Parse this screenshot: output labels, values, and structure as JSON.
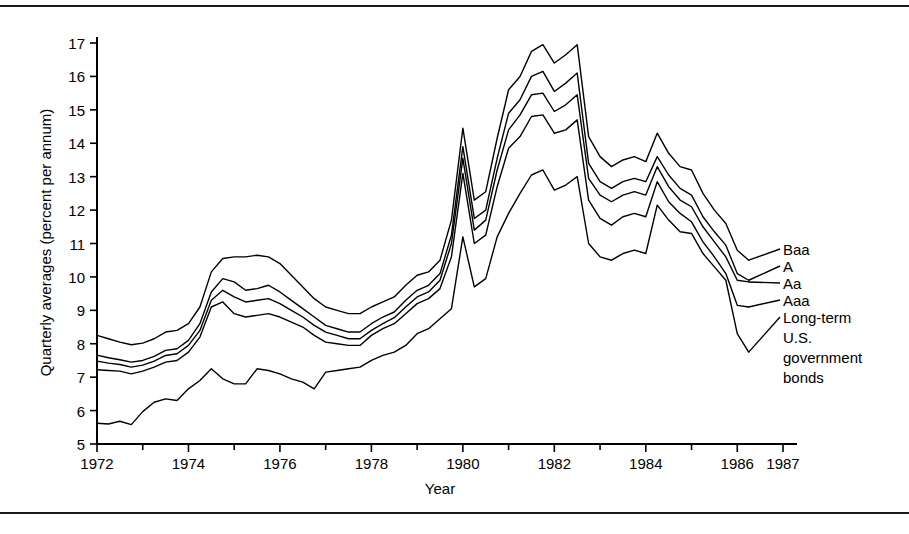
{
  "figure": {
    "background_color": "#ffffff",
    "ink_color": "#000000",
    "rule_top_label": "top-divider-rule",
    "rule_bottom_label": "bottom-divider-rule"
  },
  "chart_data": {
    "type": "line",
    "title": "",
    "subtitle": "",
    "xlabel": "Year",
    "ylabel": "Quarterly averages (percent per annum)",
    "xlim": [
      1972,
      1987
    ],
    "ylim": [
      5,
      17
    ],
    "grid": false,
    "legend_position": "right-inline-labels",
    "x_tick_labels": [
      "1972",
      "1974",
      "1976",
      "1978",
      "1980",
      "1982",
      "1984",
      "1986",
      "1987"
    ],
    "x_tick_values": [
      1972,
      1974,
      1976,
      1978,
      1980,
      1982,
      1984,
      1986,
      1987
    ],
    "x_minor_tick_values": [
      1973,
      1975,
      1977,
      1979,
      1981,
      1983,
      1985
    ],
    "y_tick_labels": [
      "5",
      "6",
      "7",
      "8",
      "9",
      "10",
      "11",
      "12",
      "13",
      "14",
      "15",
      "16",
      "17"
    ],
    "y_tick_values": [
      5,
      6,
      7,
      8,
      9,
      10,
      11,
      12,
      13,
      14,
      15,
      16,
      17
    ],
    "x": [
      1972.0,
      1972.25,
      1972.5,
      1972.75,
      1973.0,
      1973.25,
      1973.5,
      1973.75,
      1974.0,
      1974.25,
      1974.5,
      1974.75,
      1975.0,
      1975.25,
      1975.5,
      1975.75,
      1976.0,
      1976.25,
      1976.5,
      1976.75,
      1977.0,
      1977.25,
      1977.5,
      1977.75,
      1978.0,
      1978.25,
      1978.5,
      1978.75,
      1979.0,
      1979.25,
      1979.5,
      1979.75,
      1980.0,
      1980.25,
      1980.5,
      1980.75,
      1981.0,
      1981.25,
      1981.5,
      1981.75,
      1982.0,
      1982.25,
      1982.5,
      1982.75,
      1983.0,
      1983.25,
      1983.5,
      1983.75,
      1984.0,
      1984.25,
      1984.5,
      1984.75,
      1985.0,
      1985.25,
      1985.5,
      1985.75,
      1986.0,
      1986.25
    ],
    "series": [
      {
        "name": "Baa",
        "label": "Baa",
        "values": [
          8.25,
          8.15,
          8.05,
          7.97,
          8.02,
          8.15,
          8.35,
          8.4,
          8.6,
          9.1,
          10.15,
          10.55,
          10.6,
          10.6,
          10.65,
          10.6,
          10.4,
          10.05,
          9.7,
          9.35,
          9.1,
          9.0,
          8.9,
          8.9,
          9.1,
          9.25,
          9.4,
          9.75,
          10.05,
          10.15,
          10.5,
          11.7,
          14.45,
          12.3,
          12.55,
          14.15,
          15.6,
          16.0,
          16.75,
          16.95,
          16.4,
          16.65,
          16.95,
          14.2,
          13.6,
          13.3,
          13.5,
          13.6,
          13.45,
          14.3,
          13.7,
          13.3,
          13.2,
          12.5,
          12.0,
          11.6,
          10.8,
          10.5
        ]
      },
      {
        "name": "A",
        "label": "A",
        "values": [
          7.66,
          7.58,
          7.52,
          7.45,
          7.5,
          7.62,
          7.8,
          7.85,
          8.1,
          8.6,
          9.55,
          9.95,
          9.85,
          9.6,
          9.65,
          9.75,
          9.55,
          9.3,
          9.05,
          8.8,
          8.55,
          8.45,
          8.35,
          8.35,
          8.6,
          8.8,
          8.95,
          9.3,
          9.6,
          9.75,
          10.1,
          11.25,
          13.9,
          11.75,
          12.0,
          13.55,
          14.9,
          15.3,
          16.0,
          16.15,
          15.55,
          15.8,
          16.1,
          13.4,
          12.85,
          12.65,
          12.85,
          12.95,
          12.85,
          13.6,
          13.05,
          12.65,
          12.45,
          11.8,
          11.35,
          10.95,
          10.1,
          9.9
        ]
      },
      {
        "name": "Aa",
        "label": "Aa",
        "values": [
          7.48,
          7.42,
          7.38,
          7.3,
          7.36,
          7.48,
          7.65,
          7.7,
          7.95,
          8.4,
          9.3,
          9.6,
          9.4,
          9.25,
          9.3,
          9.35,
          9.2,
          9.0,
          8.8,
          8.55,
          8.35,
          8.25,
          8.15,
          8.15,
          8.4,
          8.6,
          8.78,
          9.1,
          9.4,
          9.55,
          9.9,
          11.0,
          13.55,
          11.4,
          11.7,
          13.2,
          14.4,
          14.85,
          15.45,
          15.5,
          14.95,
          15.15,
          15.45,
          12.95,
          12.45,
          12.25,
          12.45,
          12.55,
          12.45,
          13.3,
          12.7,
          12.3,
          12.1,
          11.5,
          11.05,
          10.6,
          9.9,
          9.85
        ]
      },
      {
        "name": "Aaa",
        "label": "Aaa",
        "values": [
          7.22,
          7.2,
          7.18,
          7.1,
          7.18,
          7.3,
          7.45,
          7.5,
          7.75,
          8.2,
          9.1,
          9.25,
          8.9,
          8.8,
          8.85,
          8.9,
          8.8,
          8.65,
          8.5,
          8.25,
          8.05,
          8.0,
          7.95,
          7.95,
          8.25,
          8.45,
          8.6,
          8.9,
          9.2,
          9.35,
          9.65,
          10.6,
          13.1,
          11.0,
          11.25,
          12.7,
          13.85,
          14.2,
          14.8,
          14.85,
          14.3,
          14.4,
          14.7,
          12.3,
          11.75,
          11.55,
          11.8,
          11.9,
          11.8,
          12.85,
          12.25,
          11.9,
          11.65,
          11.05,
          10.6,
          10.1,
          9.15,
          9.1
        ]
      },
      {
        "name": "Long-term U.S. government bonds",
        "label": "Long-term U.S. government bonds",
        "values": [
          5.62,
          5.6,
          5.68,
          5.58,
          5.97,
          6.25,
          6.35,
          6.3,
          6.65,
          6.9,
          7.25,
          6.95,
          6.8,
          6.8,
          7.25,
          7.2,
          7.1,
          6.95,
          6.85,
          6.65,
          7.15,
          7.2,
          7.25,
          7.3,
          7.5,
          7.65,
          7.75,
          7.95,
          8.3,
          8.45,
          8.75,
          9.05,
          11.2,
          9.7,
          9.95,
          11.2,
          11.9,
          12.5,
          13.05,
          13.2,
          12.6,
          12.75,
          13.0,
          11.0,
          10.6,
          10.5,
          10.7,
          10.8,
          10.7,
          12.15,
          11.7,
          11.35,
          11.3,
          10.7,
          10.3,
          9.9,
          8.3,
          7.75
        ]
      }
    ],
    "annotations": [
      {
        "text": "Baa",
        "target_series": "Baa",
        "target_year": 1986.25,
        "target_value": 10.5
      },
      {
        "text": "A",
        "target_series": "A",
        "target_year": 1986.25,
        "target_value": 9.9
      },
      {
        "text": "Aa",
        "target_series": "Aa",
        "target_year": 1986.25,
        "target_value": 9.85
      },
      {
        "text": "Aaa",
        "target_series": "Aaa",
        "target_year": 1986.25,
        "target_value": 9.1
      },
      {
        "text": "Long-term U.S. government bonds",
        "target_series": "Long-term U.S. government bonds",
        "target_year": 1986.25,
        "target_value": 7.75
      }
    ]
  },
  "axis_titles": {
    "x": "Year",
    "y": "Quarterly averages (percent per annum)"
  },
  "legend": {
    "baa": "Baa",
    "a": "A",
    "aa": "Aa",
    "aaa": "Aaa",
    "govt_line_1": "Long-term",
    "govt_line_2": "U.S.",
    "govt_line_3": "government",
    "govt_line_4": "bonds"
  },
  "y_ticks": [
    {
      "label": "17",
      "value": 17
    },
    {
      "label": "16",
      "value": 16
    },
    {
      "label": "15",
      "value": 15
    },
    {
      "label": "14",
      "value": 14
    },
    {
      "label": "13",
      "value": 13
    },
    {
      "label": "12",
      "value": 12
    },
    {
      "label": "11",
      "value": 11
    },
    {
      "label": "10",
      "value": 10
    },
    {
      "label": "9",
      "value": 9
    },
    {
      "label": "8",
      "value": 8
    },
    {
      "label": "7",
      "value": 7
    },
    {
      "label": "6",
      "value": 6
    },
    {
      "label": "5",
      "value": 5
    }
  ],
  "x_ticks": [
    {
      "label": "1972",
      "value": 1972
    },
    {
      "label": "1974",
      "value": 1974
    },
    {
      "label": "1976",
      "value": 1976
    },
    {
      "label": "1978",
      "value": 1978
    },
    {
      "label": "1980",
      "value": 1980
    },
    {
      "label": "1982",
      "value": 1982
    },
    {
      "label": "1984",
      "value": 1984
    },
    {
      "label": "1986",
      "value": 1986
    },
    {
      "label": "1987",
      "value": 1987
    }
  ]
}
